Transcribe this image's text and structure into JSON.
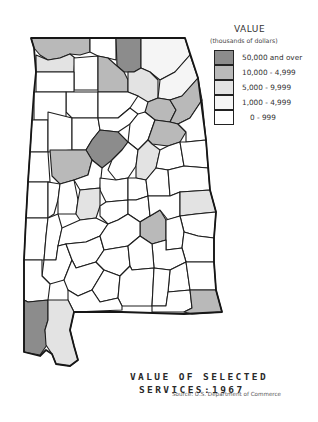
{
  "map": {
    "title_line1": "VALUE OF SELECTED",
    "title_line2": "SERVICES:1967",
    "source": "Source:  U.S. Department of Commerce",
    "region": "Alabama counties"
  },
  "legend": {
    "title": "VALUE",
    "subtitle": "(thousands of dollars)",
    "items": [
      {
        "label": "50,000 and over",
        "color": "#8c8c8c"
      },
      {
        "label": "10,000 - 4,999",
        "color": "#b9b9b9"
      },
      {
        "label": "5,000 - 9,999",
        "color": "#e3e3e3"
      },
      {
        "label": "1,000 - 4,999",
        "color": "#f5f5f5"
      },
      {
        "label": "0 - 999",
        "color": "#ffffff"
      }
    ]
  },
  "colors": {
    "class_1": "#8c8c8c",
    "class_2": "#b9b9b9",
    "class_3": "#e3e3e3",
    "class_4": "#f5f5f5",
    "class_5": "#ffffff",
    "border": "#1e1e1e"
  }
}
